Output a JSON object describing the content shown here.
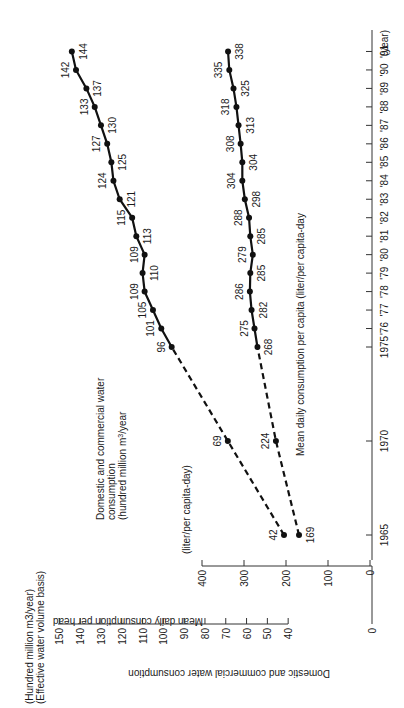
{
  "chart_data": {
    "type": "line",
    "orientation": "rotated 90deg counter-clockwise (x-axis years runs bottom-to-top on right edge)",
    "x": [
      1965,
      1970,
      1975,
      1976,
      1977,
      1978,
      1979,
      1980,
      1981,
      1982,
      1983,
      1984,
      1985,
      1986,
      1987,
      1988,
      1989,
      1990,
      1991
    ],
    "x_tick_labels": [
      "1965",
      "1970",
      "1975",
      "'76",
      "'77",
      "'78",
      "'79",
      "'80",
      "'81",
      "'82",
      "'83",
      "'84",
      "'85",
      "'86",
      "'87",
      "'88",
      "'89",
      "'90",
      "'91"
    ],
    "xlabel": "(year)",
    "series": [
      {
        "name": "Domestic and commercial water consumption (hundred million m3/year)",
        "axis": "primary",
        "values": [
          42,
          69,
          96,
          101,
          105,
          109,
          110,
          109,
          113,
          115,
          121,
          124,
          125,
          127,
          130,
          133,
          137,
          142,
          144
        ],
        "style": "dashed 1965-1975, solid 1975-1991"
      },
      {
        "name": "Mean daily consumption per capita (liter/per capita-day)",
        "axis": "secondary",
        "values": [
          169,
          224,
          268,
          275,
          282,
          286,
          285,
          279,
          285,
          288,
          298,
          304,
          304,
          308,
          313,
          318,
          325,
          335,
          338
        ],
        "style": "dashed 1965-1975, solid 1975-1991"
      }
    ],
    "primary_axis": {
      "label": "Domestic and commercial water consumption",
      "unit_label_1": "(Hundred million m3/year)",
      "unit_label_2": "(Effective water volume basis)",
      "ticks": [
        "0",
        "40",
        "50",
        "60",
        "70",
        "80",
        "90",
        "100",
        "110",
        "120",
        "130",
        "140",
        "150"
      ],
      "range": [
        0,
        150
      ],
      "axis_break": "between 0 and 40"
    },
    "secondary_axis": {
      "label": "Mean daily consumption per head",
      "unit_label": "(liter/per capita-day)",
      "ticks": [
        "0",
        "100",
        "200",
        "300",
        "400"
      ],
      "range": [
        0,
        400
      ]
    },
    "annotations": {
      "upper_series_title_1": "Domestic and commercial water",
      "upper_series_title_2": "consumption",
      "upper_series_title_3": "(hundred million m",
      "upper_series_title_3_sup": "3",
      "upper_series_title_3_end": "/year",
      "lower_series_title": "Mean daily consumption per capita (liter/per capita-day"
    },
    "grid": false,
    "legend": "none (inline series titles)"
  }
}
